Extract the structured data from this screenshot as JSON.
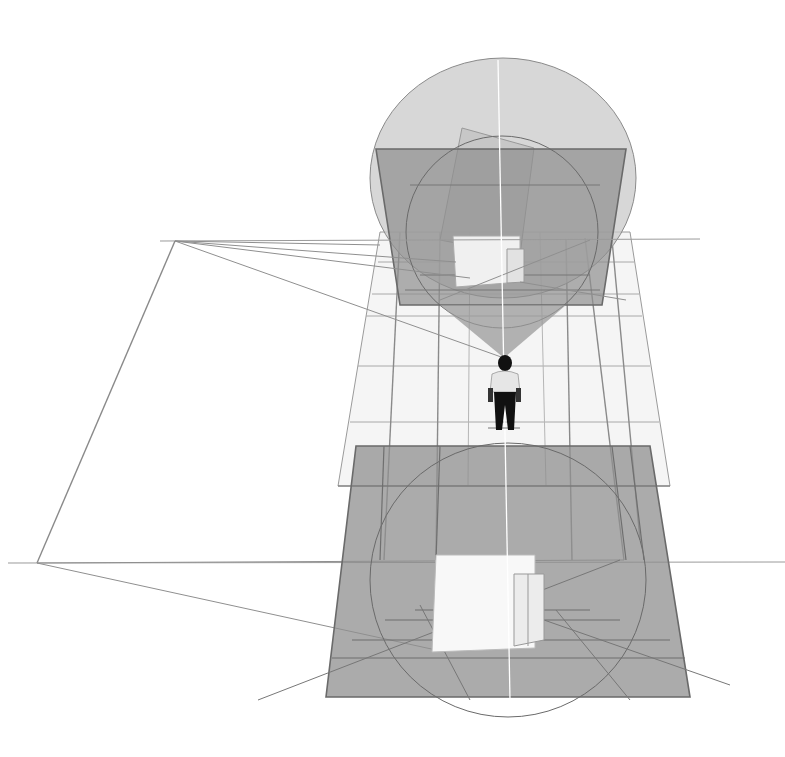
{
  "diagram": {
    "width": 785,
    "height": 757,
    "background": "#ffffff",
    "colors": {
      "plane_fill": "#8f8f8f",
      "plane_stroke": "#6a6a6a",
      "sphere_fill": "#c9c9c9",
      "ground_fill": "#f1f1f1",
      "line": "#7a7a7a",
      "box_face": "#f7f7f7",
      "box_side": "#e4e4e4",
      "figure_shirt": "#e8e8e8",
      "figure_dark": "#111111",
      "axis_line": "#ffffff"
    },
    "horizon_lines": [
      {
        "x1": 160,
        "y1": 241,
        "x2": 700,
        "y2": 239
      },
      {
        "x1": 8,
        "y1": 563,
        "x2": 785,
        "y2": 562
      }
    ],
    "left_frame": [
      [
        175,
        241
      ],
      [
        37,
        563
      ]
    ],
    "vanishing_point_upper": [
      175,
      241
    ],
    "vanishing_point_lower": [
      37,
      563
    ],
    "viewer": {
      "x": 504,
      "y": 395,
      "label": ""
    },
    "cone_of_vision": [
      [
        440,
        305
      ],
      [
        566,
        305
      ],
      [
        504,
        358
      ]
    ],
    "upper_sphere": {
      "cx": 503,
      "cy": 178,
      "rx": 133,
      "ry": 120
    },
    "upper_picture_plane": [
      [
        376,
        149
      ],
      [
        626,
        149
      ],
      [
        602,
        305
      ],
      [
        400,
        305
      ]
    ],
    "upper_circle": {
      "cx": 502,
      "cy": 232,
      "rx": 96,
      "ry": 96
    },
    "lower_picture_plane": [
      [
        356,
        446
      ],
      [
        650,
        446
      ],
      [
        690,
        697
      ],
      [
        326,
        697
      ]
    ],
    "lower_circle": {
      "cx": 508,
      "cy": 580,
      "rx": 138,
      "ry": 137
    },
    "ground_grid": {
      "outline": [
        [
          380,
          232
        ],
        [
          630,
          232
        ],
        [
          670,
          486
        ],
        [
          338,
          486
        ]
      ]
    },
    "boxes": [
      {
        "name": "upper-box-large",
        "pts": [
          [
            453,
            236
          ],
          [
            520,
            236
          ],
          [
            520,
            282
          ],
          [
            456,
            287
          ]
        ]
      },
      {
        "name": "upper-box-small",
        "pts": [
          [
            507,
            249
          ],
          [
            524,
            249
          ],
          [
            524,
            282
          ],
          [
            507,
            283
          ]
        ]
      },
      {
        "name": "lower-box-large",
        "pts": [
          [
            436,
            555
          ],
          [
            535,
            555
          ],
          [
            535,
            648
          ],
          [
            432,
            652
          ]
        ]
      },
      {
        "name": "lower-box-small",
        "pts": [
          [
            514,
            574
          ],
          [
            544,
            574
          ],
          [
            544,
            640
          ],
          [
            514,
            646
          ]
        ]
      }
    ]
  }
}
